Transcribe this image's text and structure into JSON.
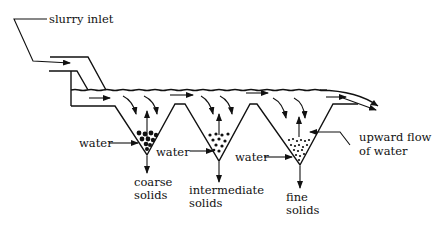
{
  "diagram": {
    "type": "hydraulic classifier (settling cones)",
    "labels": {
      "slurry_inlet": "slurry inlet",
      "water_1": "water",
      "water_2": "water",
      "water_3": "water",
      "upward_flow_line1": "upward flow",
      "upward_flow_line2": "of water",
      "coarse_line1": "coarse",
      "coarse_line2": "solids",
      "intermediate_line1": "intermediate",
      "intermediate_line2": "solids",
      "fine_line1": "fine",
      "fine_line2": "solids"
    },
    "cones": [
      {
        "name": "coarse",
        "particle_size": "large"
      },
      {
        "name": "intermediate",
        "particle_size": "medium"
      },
      {
        "name": "fine",
        "particle_size": "small"
      }
    ],
    "colors": {
      "ink": "#111111",
      "background": "#ffffff"
    }
  }
}
